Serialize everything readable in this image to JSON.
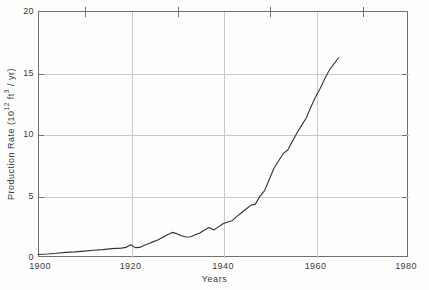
{
  "figure": {
    "background_color": "#fefefe",
    "frame_color": "#6f6f6f",
    "grid_color": "#c9c9c9",
    "curve_color": "#333333"
  },
  "axes": {
    "x_title": "Years",
    "y_title_prefix": "Production Rate (10",
    "y_title_exp1": "12",
    "y_title_mid": " ft",
    "y_title_exp2": "3",
    "y_title_suffix": " / yr)",
    "x_ticks": [
      "1900",
      "1920",
      "1940",
      "1960",
      "1980"
    ],
    "y_ticks": [
      "0",
      "5",
      "10",
      "15",
      "20"
    ],
    "x_minor_ticks": [
      "1910",
      "1930",
      "1950",
      "1970"
    ]
  },
  "chart_data": {
    "type": "line",
    "title": "",
    "subtitle": "",
    "xlabel": "Years",
    "ylabel": "Production Rate (10^12 ft^3 / yr)",
    "xlim": [
      1900,
      1980
    ],
    "ylim": [
      0,
      20
    ],
    "xticks": [
      1900,
      1920,
      1940,
      1960,
      1980
    ],
    "yticks": [
      0,
      5,
      10,
      15,
      20
    ],
    "xticks_minor": [
      1910,
      1930,
      1950,
      1970
    ],
    "grid": true,
    "grid_axes": "both",
    "legend": null,
    "legend_position": "none",
    "annotations": [],
    "series": [
      {
        "name": "Natural gas production rate",
        "units": "10^12 ft^3 / yr",
        "x": [
          1900,
          1902,
          1904,
          1906,
          1908,
          1910,
          1912,
          1914,
          1916,
          1918,
          1919,
          1920,
          1921,
          1922,
          1923,
          1924,
          1925,
          1926,
          1927,
          1928,
          1929,
          1930,
          1931,
          1932,
          1933,
          1934,
          1935,
          1936,
          1937,
          1938,
          1939,
          1940,
          1941,
          1942,
          1943,
          1944,
          1945,
          1946,
          1947,
          1948,
          1949,
          1950,
          1951,
          1952,
          1953,
          1954,
          1955,
          1956,
          1957,
          1958,
          1959,
          1960,
          1961,
          1962,
          1963,
          1964,
          1965
        ],
        "y": [
          0.2,
          0.24,
          0.3,
          0.38,
          0.42,
          0.48,
          0.55,
          0.6,
          0.68,
          0.72,
          0.78,
          1.0,
          0.76,
          0.78,
          0.95,
          1.1,
          1.25,
          1.4,
          1.6,
          1.8,
          2.0,
          1.9,
          1.72,
          1.62,
          1.65,
          1.8,
          1.95,
          2.2,
          2.4,
          2.2,
          2.45,
          2.7,
          2.85,
          2.95,
          3.3,
          3.6,
          3.9,
          4.2,
          4.3,
          4.95,
          5.4,
          6.3,
          7.2,
          7.8,
          8.4,
          8.7,
          9.4,
          10.1,
          10.7,
          11.3,
          12.2,
          13.0,
          13.7,
          14.5,
          15.2,
          15.7,
          16.2
        ]
      }
    ]
  }
}
